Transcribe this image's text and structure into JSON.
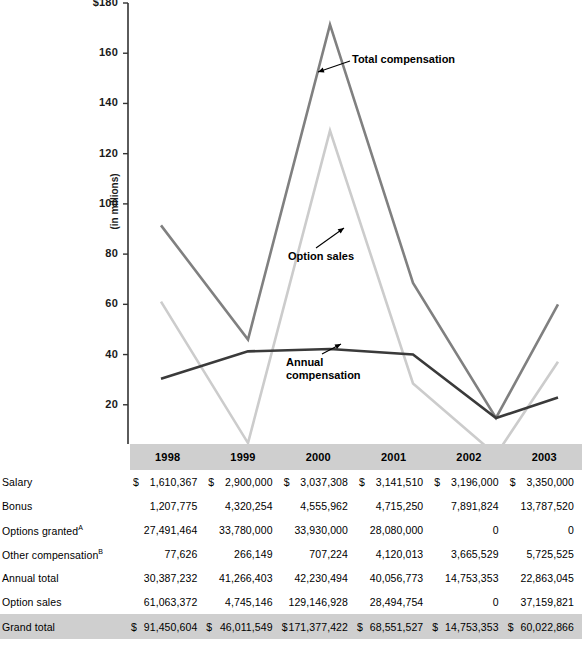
{
  "chart_data": {
    "type": "line",
    "title": "",
    "xlabel": "",
    "ylabel": "(in millions)",
    "ylim": [
      0,
      180
    ],
    "ytick_labels": [
      "$180",
      "160",
      "140",
      "120",
      "100",
      "80",
      "60",
      "40",
      "20",
      "0"
    ],
    "ytick_values": [
      180,
      160,
      140,
      120,
      100,
      80,
      60,
      40,
      20,
      0
    ],
    "grid": false,
    "legend": "inline-annotations",
    "categories": [
      "1998",
      "1999",
      "2000",
      "2001",
      "2002",
      "2003"
    ],
    "series": [
      {
        "name": "Total compensation",
        "color": "#808080",
        "values": [
          91.45,
          46.01,
          171.38,
          68.55,
          14.75,
          60.02
        ]
      },
      {
        "name": "Option sales",
        "color": "#cccccc",
        "values": [
          61.06,
          4.75,
          129.15,
          28.49,
          0.0,
          37.16
        ]
      },
      {
        "name": "Annual compensation",
        "color": "#3a3a3a",
        "values": [
          30.39,
          41.27,
          42.23,
          40.06,
          14.75,
          22.86
        ]
      }
    ],
    "annotations": [
      {
        "label": "Total compensation",
        "series": "Total compensation",
        "anchor_year": "2000"
      },
      {
        "label": "Option sales",
        "series": "Option sales",
        "anchor_year": "2000"
      },
      {
        "label": "Annual compensation",
        "series": "Annual compensation",
        "anchor_year": "2001"
      }
    ]
  },
  "table": {
    "blank_header": "",
    "columns": [
      "1998",
      "1999",
      "2000",
      "2001",
      "2002",
      "2003"
    ],
    "rows": [
      {
        "label": "Salary",
        "label_sup": "",
        "currency": [
          "$",
          "$",
          "$",
          "$",
          "$",
          "$"
        ],
        "values": [
          "1,610,367",
          "2,900,000",
          "3,037,308",
          "3,141,510",
          "3,196,000",
          "3,350,000"
        ]
      },
      {
        "label": "Bonus",
        "label_sup": "",
        "currency": [
          "",
          "",
          "",
          "",
          "",
          ""
        ],
        "values": [
          "1,207,775",
          "4,320,254",
          "4,555,962",
          "4,715,250",
          "7,891,824",
          "13,787,520"
        ]
      },
      {
        "label": "Options granted",
        "label_sup": "A",
        "currency": [
          "",
          "",
          "",
          "",
          "",
          ""
        ],
        "values": [
          "27,491,464",
          "33,780,000",
          "33,930,000",
          "28,080,000",
          "0",
          "0"
        ]
      },
      {
        "label": "Other compensation",
        "label_sup": "B",
        "currency": [
          "",
          "",
          "",
          "",
          "",
          ""
        ],
        "values": [
          "77,626",
          "266,149",
          "707,224",
          "4,120,013",
          "3,665,529",
          "5,725,525"
        ]
      },
      {
        "label": "Annual total",
        "label_sup": "",
        "currency": [
          "",
          "",
          "",
          "",
          "",
          ""
        ],
        "values": [
          "30,387,232",
          "41,266,403",
          "42,230,494",
          "40,056,773",
          "14,753,353",
          "22,863,045"
        ]
      },
      {
        "label": "Option sales",
        "label_sup": "",
        "currency": [
          "",
          "",
          "",
          "",
          "",
          ""
        ],
        "values": [
          "61,063,372",
          "4,745,146",
          "129,146,928",
          "28,494,754",
          "0",
          "37,159,821"
        ]
      }
    ],
    "total_row": {
      "label": "Grand total",
      "currency": [
        "$",
        "$",
        "$",
        "$",
        "$",
        "$"
      ],
      "values": [
        "91,450,604",
        "46,011,549",
        "171,377,422",
        "68,551,527",
        "14,753,353",
        "60,022,866"
      ]
    }
  },
  "colors": {
    "band_gray": "#cfcfcf",
    "axis": "#333333",
    "total_compensation": "#808080",
    "option_sales": "#cccccc",
    "annual_compensation": "#3a3a3a"
  }
}
